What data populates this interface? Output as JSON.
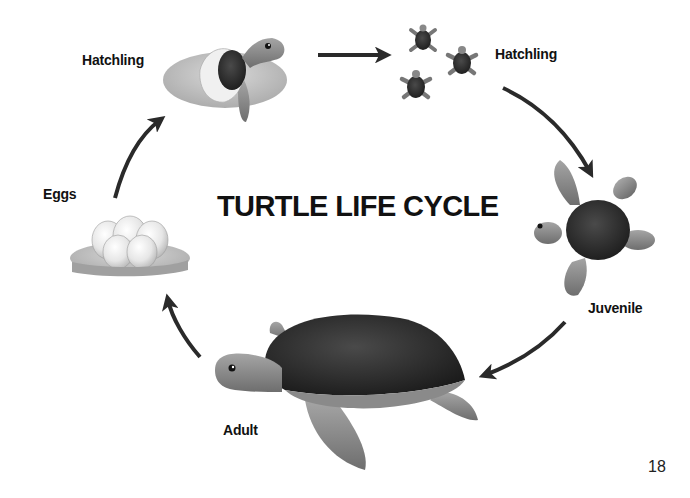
{
  "diagram": {
    "title": "TURTLE LIFE CYCLE",
    "type": "cycle",
    "stages": [
      {
        "id": "eggs",
        "label": "Eggs"
      },
      {
        "id": "hatchling-emerging",
        "label": "Hatchling"
      },
      {
        "id": "hatchlings",
        "label": "Hatchling"
      },
      {
        "id": "juvenile",
        "label": "Juvenile"
      },
      {
        "id": "adult",
        "label": "Adult"
      }
    ],
    "flow": [
      "Eggs",
      "Hatchling",
      "Hatchling",
      "Juvenile",
      "Adult",
      "Eggs"
    ],
    "arrow_color": "#2a2a2a"
  },
  "page": {
    "number": "18"
  }
}
